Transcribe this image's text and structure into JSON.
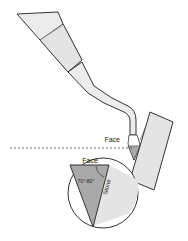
{
  "diagram": {
    "labels": {
      "face_top": "Face",
      "face_inset": "Face",
      "angle": "70°-80°",
      "side": "Stone"
    },
    "colors": {
      "instrument_fill": "#e9e9e9",
      "instrument_stroke": "#333333",
      "tooth_fill": "#e4e4e4",
      "blade_fill": "#a9a9a9",
      "circle_fill": "#ffffff",
      "dashed_line": "#444444"
    }
  }
}
